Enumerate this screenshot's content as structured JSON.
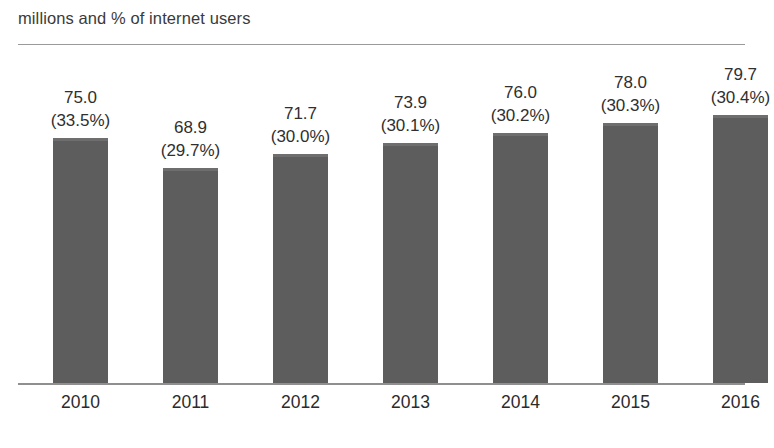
{
  "chart_data": {
    "type": "bar",
    "title": "millions and % of internet users",
    "xlabel": "",
    "ylabel": "millions and % of internet users",
    "categories": [
      "2010",
      "2011",
      "2012",
      "2013",
      "2014",
      "2015",
      "2016"
    ],
    "values": [
      75.0,
      68.9,
      71.7,
      73.9,
      76.0,
      78.0,
      79.7
    ],
    "percent_values": [
      33.5,
      29.7,
      30.0,
      30.1,
      30.2,
      30.3,
      30.4
    ],
    "value_labels": [
      "75.0",
      "68.9",
      "71.7",
      "73.9",
      "76.0",
      "78.0",
      "79.7"
    ],
    "percent_labels": [
      "(33.5%)",
      "(29.7%)",
      "(30.0%)",
      "(30.1%)",
      "(30.2%)",
      "(30.3%)",
      "(30.4%)"
    ],
    "ylim": [
      25.1,
      79.7
    ],
    "grid": false,
    "legend": null,
    "bar_color": "#5d5d5d",
    "axis_color": "#8f8f8f",
    "points": [
      {
        "category": "2010",
        "value": 75.0,
        "percent": 33.5,
        "value_label": "75.0",
        "percent_label": "(33.5%)"
      },
      {
        "category": "2011",
        "value": 68.9,
        "percent": 29.7,
        "value_label": "68.9",
        "percent_label": "(29.7%)"
      },
      {
        "category": "2012",
        "value": 71.7,
        "percent": 30.0,
        "value_label": "71.7",
        "percent_label": "(30.0%)"
      },
      {
        "category": "2013",
        "value": 73.9,
        "percent": 30.1,
        "value_label": "73.9",
        "percent_label": "(30.1%)"
      },
      {
        "category": "2014",
        "value": 76.0,
        "percent": 30.2,
        "value_label": "76.0",
        "percent_label": "(30.2%)"
      },
      {
        "category": "2015",
        "value": 78.0,
        "percent": 30.3,
        "value_label": "78.0",
        "percent_label": "(30.3%)"
      },
      {
        "category": "2016",
        "value": 79.7,
        "percent": 30.4,
        "value_label": "79.7",
        "percent_label": "(30.4%)"
      }
    ]
  },
  "footnote": {
    "text": "",
    "visible": false
  }
}
